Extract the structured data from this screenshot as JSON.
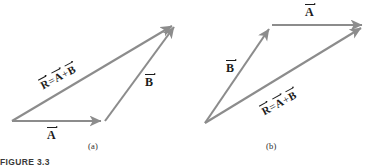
{
  "figure": {
    "number_label": "FIGURE 3.3",
    "stroke_color": "#8c8c8c",
    "text_color": "#1c1c1c",
    "background": "#ffffff",
    "width": 376,
    "height": 167
  },
  "panels": [
    {
      "id": "panel-a",
      "subcaption": "(a)",
      "labels": {
        "vector_a": "A",
        "vector_b": "B",
        "resultant_r": "R",
        "equals": "=",
        "plus": "+"
      },
      "vectors": [
        {
          "name": "A",
          "x1": 12,
          "y1": 121,
          "x2": 105,
          "y2": 121
        },
        {
          "name": "B",
          "x1": 105,
          "y1": 121,
          "x2": 177,
          "y2": 23
        },
        {
          "name": "R",
          "x1": 12,
          "y1": 121,
          "x2": 177,
          "y2": 23
        }
      ]
    },
    {
      "id": "panel-b",
      "subcaption": "(b)",
      "labels": {
        "vector_a": "A",
        "vector_b": "B",
        "resultant_r": "R",
        "equals": "=",
        "plus": "+"
      },
      "vectors": [
        {
          "name": "B",
          "x1": 205,
          "y1": 123,
          "x2": 272,
          "y2": 25
        },
        {
          "name": "A",
          "x1": 272,
          "y1": 25,
          "x2": 366,
          "y2": 25
        },
        {
          "name": "R",
          "x1": 205,
          "y1": 123,
          "x2": 366,
          "y2": 25
        }
      ]
    }
  ]
}
